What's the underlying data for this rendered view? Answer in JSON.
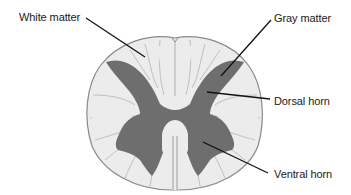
{
  "diagram": {
    "colors": {
      "white_matter": "#ececec",
      "white_matter_outline": "#8a8a8a",
      "gray_matter": "#6e6e6e",
      "leader_line": "#111111",
      "background": "#ffffff",
      "label_text": "#1a1a1a"
    },
    "labels": [
      {
        "id": "white-matter",
        "text": "White matter",
        "x": 19,
        "y": 11,
        "line": {
          "x1": 86,
          "y1": 18,
          "x2": 145,
          "y2": 57
        }
      },
      {
        "id": "gray-matter",
        "text": "Gray matter",
        "x": 274,
        "y": 12,
        "line": {
          "x1": 271,
          "y1": 20,
          "x2": 221,
          "y2": 76
        }
      },
      {
        "id": "dorsal-horn",
        "text": "Dorsal horn",
        "x": 274,
        "y": 95,
        "line": {
          "x1": 270,
          "y1": 99,
          "x2": 207,
          "y2": 92
        }
      },
      {
        "id": "ventral-horn",
        "text": "Ventral horn",
        "x": 274,
        "y": 168,
        "line": {
          "x1": 268,
          "y1": 173,
          "x2": 203,
          "y2": 142
        }
      }
    ]
  }
}
